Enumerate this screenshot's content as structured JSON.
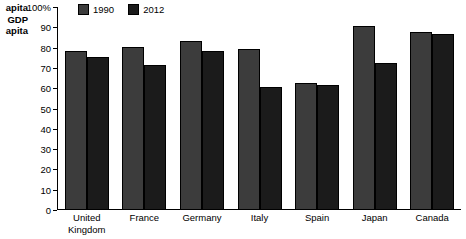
{
  "chart_data": {
    "type": "bar",
    "title": "",
    "ylabel_lines": [
      "apita",
      "GDP",
      "apita"
    ],
    "ylabel_note": "axis title clipped at left image edge",
    "xlabel": "",
    "categories": [
      "United Kingdom",
      "France",
      "Germany",
      "Italy",
      "Spain",
      "Japan",
      "Canada"
    ],
    "category_lines": [
      [
        "United",
        "Kingdom"
      ],
      [
        "France"
      ],
      [
        "Germany"
      ],
      [
        "Italy"
      ],
      [
        "Spain"
      ],
      [
        "Japan"
      ],
      [
        "Canada"
      ]
    ],
    "series": [
      {
        "name": "1990",
        "color": "#3c3c3c",
        "values": [
          78,
          80,
          83,
          79,
          62,
          90,
          87
        ]
      },
      {
        "name": "2012",
        "color": "#1b1b1b",
        "values": [
          75,
          71,
          78,
          60,
          61,
          72,
          86
        ]
      }
    ],
    "ylim": [
      0,
      100
    ],
    "ytick_values": [
      0,
      10,
      20,
      30,
      40,
      50,
      60,
      70,
      80,
      90,
      100
    ],
    "ytick_labels": [
      "0",
      "10",
      "20",
      "30",
      "40",
      "50",
      "60",
      "70",
      "80",
      "90",
      "100%"
    ],
    "grid": false,
    "legend_position": "top-left"
  },
  "legend": {
    "items": [
      {
        "label": "1990",
        "color": "#3c3c3c"
      },
      {
        "label": "2012",
        "color": "#1b1b1b"
      }
    ]
  }
}
